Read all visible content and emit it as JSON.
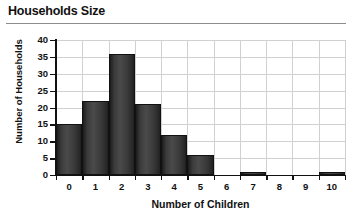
{
  "chart_data": {
    "type": "bar",
    "title": "Households Size",
    "xlabel": "Number of Children",
    "ylabel": "Number of Households",
    "categories": [
      "0",
      "1",
      "2",
      "3",
      "4",
      "5",
      "6",
      "7",
      "8",
      "9",
      "10"
    ],
    "values": [
      15,
      22,
      36,
      21,
      12,
      6,
      0,
      1,
      0,
      0,
      1
    ],
    "ylim": [
      0,
      40
    ],
    "yticks": [
      0,
      5,
      10,
      15,
      20,
      25,
      30,
      35,
      40
    ],
    "ytick_labels": [
      "0",
      "5",
      "10",
      "15",
      "20",
      "25",
      "30",
      "35",
      "40"
    ],
    "xlim": [
      -0.5,
      10.5
    ],
    "grid": "both",
    "legend": "none",
    "bar_color": "#3a3a3a",
    "bar_edge_color": "#111111",
    "grid_color": "#d0d0d0",
    "axis_color": "#111111",
    "background": "#ffffff"
  },
  "header": {
    "title": "Households Size",
    "rule_color": "#8d8d8d"
  }
}
